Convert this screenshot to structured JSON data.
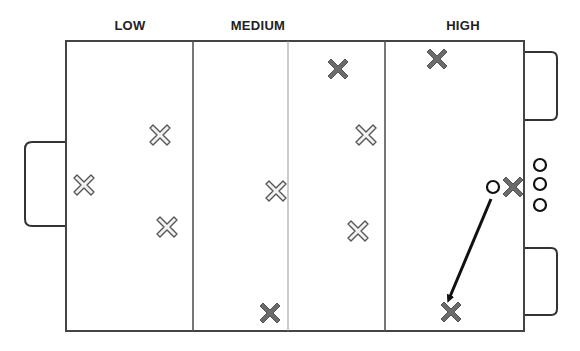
{
  "diagram": {
    "type": "field-zone-diagram",
    "zones": [
      {
        "label": "LOW",
        "label_x": 130
      },
      {
        "label": "MEDIUM",
        "label_x": 258
      },
      {
        "label": "HIGH",
        "label_x": 463
      }
    ],
    "colors": {
      "line": "#444444",
      "midline": "#999999",
      "dark_marker": "#6b6b6b",
      "light_marker_fill": "#f2f2f2",
      "light_marker_stroke": "#555555",
      "circle": "#111111",
      "arrow": "#111111"
    },
    "light_x_markers": [
      {
        "x": 160,
        "y": 135
      },
      {
        "x": 84,
        "y": 185
      },
      {
        "x": 167,
        "y": 227
      },
      {
        "x": 276,
        "y": 191
      },
      {
        "x": 366,
        "y": 135
      },
      {
        "x": 358,
        "y": 231
      }
    ],
    "dark_x_markers": [
      {
        "x": 338,
        "y": 69
      },
      {
        "x": 437,
        "y": 59
      },
      {
        "x": 513,
        "y": 187
      },
      {
        "x": 270,
        "y": 313
      },
      {
        "x": 451,
        "y": 312
      }
    ],
    "circles": [
      {
        "x": 493,
        "y": 187
      },
      {
        "x": 540,
        "y": 165
      },
      {
        "x": 540,
        "y": 184
      },
      {
        "x": 540,
        "y": 205
      }
    ],
    "arrow": {
      "from": {
        "x": 491,
        "y": 199
      },
      "to": {
        "x": 449,
        "y": 299
      }
    }
  }
}
